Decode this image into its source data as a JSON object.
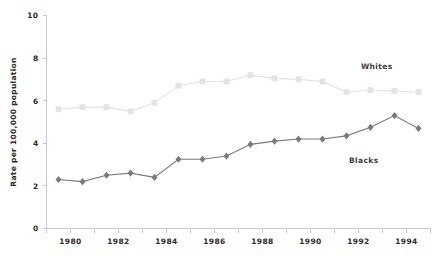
{
  "chart_data": {
    "type": "line",
    "title": "",
    "subtitle": "",
    "xlabel": "",
    "ylabel": "Rate per 100,000 population",
    "xlim": [
      1979,
      1995
    ],
    "ylim": [
      0,
      10
    ],
    "grid": false,
    "legend_position": "inline-right",
    "y_ticks": [
      "0",
      "2",
      "4",
      "6",
      "8",
      "10"
    ],
    "y_tick_values": [
      0,
      2,
      4,
      6,
      8,
      10
    ],
    "x_ticks": [
      "1980",
      "1982",
      "1984",
      "1986",
      "1988",
      "1990",
      "1992",
      "1994"
    ],
    "x_tick_values": [
      1980,
      1982,
      1984,
      1986,
      1988,
      1990,
      1992,
      1994
    ],
    "x_minor_tick_values": [
      1979,
      1981,
      1983,
      1985,
      1987,
      1989,
      1991,
      1993,
      1995
    ],
    "x": [
      1979.5,
      1980.5,
      1981.5,
      1982.5,
      1983.5,
      1984.5,
      1985.5,
      1986.5,
      1987.5,
      1988.5,
      1989.5,
      1990.5,
      1991.5,
      1992.5,
      1993.5,
      1994.5
    ],
    "series": [
      {
        "name": "Whites",
        "color": "#e3e3e3",
        "marker": "square",
        "label_x": 1992.1,
        "label_y": 7.6,
        "values": [
          5.6,
          5.7,
          5.7,
          5.5,
          5.9,
          6.7,
          6.9,
          6.9,
          7.2,
          7.05,
          7.0,
          6.9,
          6.4,
          6.5,
          6.45,
          6.4
        ]
      },
      {
        "name": "Blacks",
        "color": "#7a7a7a",
        "marker": "diamond",
        "label_x": 1991.6,
        "label_y": 3.2,
        "values": [
          2.3,
          2.2,
          2.5,
          2.6,
          2.4,
          3.25,
          3.25,
          3.4,
          3.95,
          4.1,
          4.2,
          4.2,
          4.35,
          4.75,
          5.3,
          4.7
        ]
      }
    ]
  },
  "colors": {
    "whites": "#e3e3e3",
    "blacks": "#7a7a7a",
    "axis": "#c9c9c9",
    "text": "#2b2b2b",
    "background": "#ffffff"
  },
  "axis": {
    "y_title": "Rate per 100,000 population"
  }
}
